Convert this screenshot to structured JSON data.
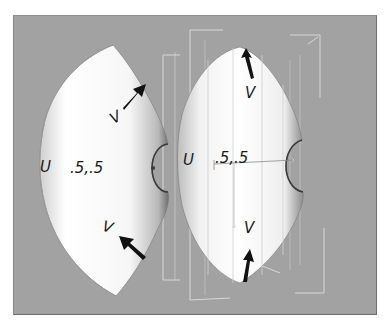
{
  "figure": {
    "background_color": "#a2a2a2",
    "surface_color": "#ffffff",
    "wireframe_color": "#e6e6e6",
    "arrow_color": "#111111"
  },
  "left_surface": {
    "u_label": "U",
    "center_label": ".5,.5",
    "v_label_top": "V",
    "v_label_bottom": "V"
  },
  "right_surface": {
    "u_label": "U",
    "center_label": ".5,.5",
    "v_label_top": "V",
    "v_label_bottom": "V"
  }
}
